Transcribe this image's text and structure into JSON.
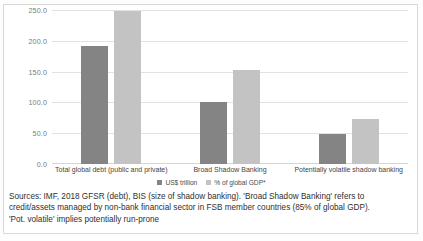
{
  "chart_data": {
    "type": "bar",
    "title": "",
    "xlabel": "",
    "ylabel": "",
    "ylim": [
      0,
      250
    ],
    "grid": true,
    "legend_position": "bottom-center",
    "categories": [
      "Total global debt (public and private)",
      "Broad Shadow Banking",
      "Potentially volatile shadow banking"
    ],
    "yticks": [
      "0.0",
      "50.0",
      "100.0",
      "150.0",
      "200.0",
      "250.0"
    ],
    "ytick_values": [
      0,
      50,
      100,
      150,
      200,
      250
    ],
    "series": [
      {
        "name": "US$ trillion",
        "color": "#848484",
        "values": [
          193,
          102,
          49
        ]
      },
      {
        "name": "% of global GDP*",
        "color": "#c3c3c3",
        "values": [
          250,
          153,
          73
        ]
      }
    ]
  },
  "notes": {
    "line1": "Sources: IMF, 2018 GFSR (debt), BIS (size of shadow banking). 'Broad Shadow Banking' refers to",
    "line2": "credit/assets managed by non-bank financial sector in FSB member countries (85% of global GDP).",
    "line3": "'Pot. volatile' implies potentially run-prone"
  }
}
